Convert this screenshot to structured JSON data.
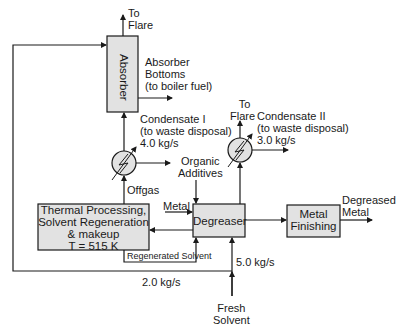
{
  "diagram": {
    "type": "process-flow",
    "units": {
      "absorber": {
        "label": "Absorber"
      },
      "heat_exchanger_1": {
        "label": "Condenser I"
      },
      "heat_exchanger_2": {
        "label": "Condenser II"
      },
      "thermal": {
        "lines": [
          "Thermal Processing,",
          "Solvent Regeneration",
          "& makeup",
          "T = 515 K"
        ]
      },
      "degreaser": {
        "label": "Degreaser"
      },
      "metal_finishing": {
        "lines": [
          "Metal",
          "Finishing"
        ]
      }
    },
    "streams": {
      "to_flare_1": {
        "lines": [
          "To",
          "Flare"
        ]
      },
      "absorber_bottoms": {
        "lines": [
          "Absorber",
          "Bottoms",
          "(to boiler fuel)"
        ]
      },
      "condensate_1": {
        "lines": [
          "Condensate I",
          "(to waste disposal)",
          "4.0 kg/s"
        ]
      },
      "to_flare_2": {
        "lines": [
          "To",
          "Flare"
        ]
      },
      "condensate_2": {
        "lines": [
          "Condensate II",
          "(to waste disposal)",
          "3.0 kg/s"
        ]
      },
      "organic_additives": {
        "lines": [
          "Organic",
          "Additives"
        ]
      },
      "offgas": {
        "label": "Offgas"
      },
      "metal": {
        "label": "Metal"
      },
      "degreased_metal": {
        "lines": [
          "Degreased",
          "Metal"
        ]
      },
      "regenerated_solvent": {
        "label": "Regenerated Solvent"
      },
      "recycle_flow": {
        "label": "2.0 kg/s"
      },
      "fresh_flow": {
        "label": "5.0 kg/s"
      },
      "fresh_solvent": {
        "lines": [
          "Fresh",
          "Solvent"
        ]
      }
    },
    "colors": {
      "box_fill": "#e2e2e2",
      "line": "#1a1a1a",
      "background": "#ffffff"
    }
  }
}
